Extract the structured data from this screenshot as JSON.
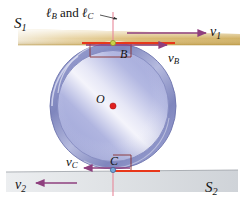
{
  "figure": {
    "surfaces": {
      "top": {
        "name": "S1",
        "letter": "S",
        "subscript": "1",
        "color": "#d2a64a"
      },
      "bottom": {
        "name": "S2",
        "letter": "S",
        "subscript": "2",
        "color": "#b9bcc0"
      }
    },
    "line_label": {
      "prefix": "ℓ",
      "sub1": "B",
      "conjunction": "and",
      "prefix2": "ℓ",
      "sub2": "C"
    },
    "vectors": [
      {
        "id": "v1",
        "letter": "v",
        "subscript": "1",
        "direction": "right",
        "color": "#8e3f7e"
      },
      {
        "id": "vB",
        "letter": "v",
        "subscript": "B",
        "direction": "right",
        "color": "#8e3f7e"
      },
      {
        "id": "vC",
        "letter": "v",
        "subscript": "C",
        "direction": "left",
        "color": "#8e3f7e"
      },
      {
        "id": "v2",
        "letter": "v",
        "subscript": "2",
        "direction": "left",
        "color": "#8e3f7e"
      }
    ],
    "points": [
      {
        "id": "O",
        "label": "O",
        "role": "center",
        "color": "#e02020"
      },
      {
        "id": "B",
        "label": "B",
        "role": "top-contact",
        "color": "#b9c944"
      },
      {
        "id": "C",
        "label": "C",
        "role": "bottom-contact",
        "color": "#7a9ccc"
      }
    ],
    "colors": {
      "wheel_rim": "#8e95c9",
      "wheel_face": "#b9bce0",
      "contact_segment": "#e8371a",
      "axis_line": "#e8889a",
      "right_angle_mark": "#8a3030"
    }
  }
}
